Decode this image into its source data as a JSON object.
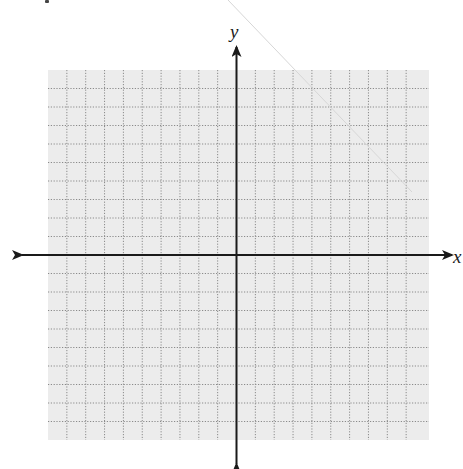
{
  "diagram": {
    "type": "coordinate-plane",
    "axis_labels": {
      "x": "x",
      "y": "y"
    },
    "grid": {
      "x_min": -10,
      "x_max": 10,
      "y_min": -10,
      "y_max": 10,
      "step": 1,
      "line_style": "dotted",
      "background": "#ececec",
      "line_color": "#8a8a8a"
    },
    "axes": {
      "color": "#1a1a1a",
      "arrows": [
        "left",
        "right",
        "up",
        "down"
      ]
    },
    "origin_px": {
      "x": 236.5,
      "y": 255
    },
    "grid_px": {
      "left": 48,
      "top": 70,
      "right": 429,
      "bottom": 440
    },
    "arrow_tips_px": {
      "left": 22,
      "right": 452,
      "top": 47,
      "bottom": 464
    }
  }
}
